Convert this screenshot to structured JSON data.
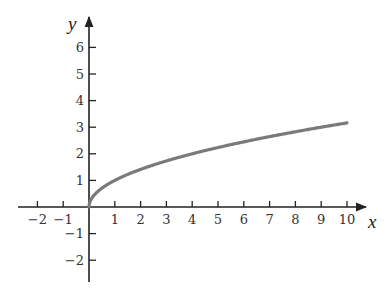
{
  "chart_data": {
    "type": "line",
    "title": "",
    "function": "y = sqrt(x)",
    "xlabel": "x",
    "ylabel": "y",
    "xlim": [
      -2.5,
      11.5
    ],
    "ylim": [
      -2.8,
      7.0
    ],
    "grid": false,
    "legend": null,
    "x_ticks": [
      -2,
      -1,
      1,
      2,
      3,
      4,
      5,
      6,
      7,
      8,
      9,
      10
    ],
    "x_tick_labels": [
      "−2",
      "−1",
      "1",
      "2",
      "3",
      "4",
      "5",
      "6",
      "7",
      "8",
      "9",
      "10"
    ],
    "y_ticks": [
      6,
      5,
      4,
      3,
      2,
      1,
      -1,
      -2
    ],
    "y_tick_labels": [
      "6",
      "5",
      "4",
      "3",
      "2",
      "1",
      "−1",
      "−2"
    ],
    "series": [
      {
        "name": "sqrt(x)",
        "x": [
          0,
          0.25,
          0.5,
          1,
          2,
          3,
          4,
          5,
          6,
          7,
          8,
          9,
          10
        ],
        "y": [
          0,
          0.5,
          0.71,
          1,
          1.41,
          1.73,
          2,
          2.24,
          2.45,
          2.65,
          2.83,
          3,
          3.16
        ],
        "color": "#7a7a7a"
      }
    ]
  },
  "colors": {
    "axis": "#222222",
    "curve": "#7a7a7a",
    "background": "#ffffff"
  }
}
